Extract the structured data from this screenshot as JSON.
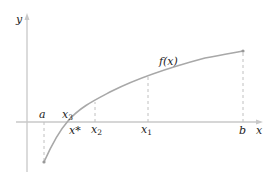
{
  "diagram": {
    "type": "function-plot-root-finding",
    "axes": {
      "x_label": "x",
      "y_label": "y"
    },
    "function_label": "f(x)",
    "points": [
      {
        "id": "a",
        "label": "a",
        "sub": ""
      },
      {
        "id": "x3",
        "label": "x",
        "sub": "3"
      },
      {
        "id": "xstar",
        "label": "x*",
        "sub": ""
      },
      {
        "id": "x2",
        "label": "x",
        "sub": "2"
      },
      {
        "id": "x1",
        "label": "x",
        "sub": "1"
      },
      {
        "id": "b",
        "label": "b",
        "sub": ""
      }
    ],
    "colors": {
      "axis": "#c8c8c8",
      "curve": "#a8a8a8",
      "dashed": "#c0c0c0",
      "text": "#222222"
    }
  }
}
